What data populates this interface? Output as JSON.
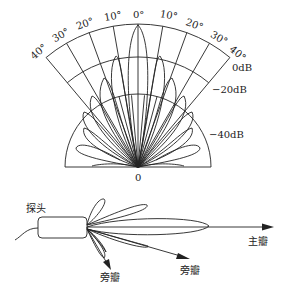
{
  "polar_pattern": {
    "angle_labels_left": [
      "40°",
      "30°",
      "20°",
      "10°"
    ],
    "angle_label_center": "0°",
    "angle_labels_right": [
      "10°",
      "20°",
      "30°",
      "40°"
    ],
    "level_labels": [
      "0dB",
      "−20dB",
      "−40dB"
    ],
    "origin_label": "0",
    "angles_deg": [
      -40,
      -30,
      -20,
      -10,
      0,
      10,
      20,
      30,
      40
    ]
  },
  "probe_diagram": {
    "probe_label": "探头",
    "main_lobe_label": "主瓣",
    "side_lobe_label_1": "旁瓣",
    "side_lobe_label_2": "旁瓣"
  },
  "colors": {
    "line": "#222222",
    "background": "#ffffff"
  }
}
